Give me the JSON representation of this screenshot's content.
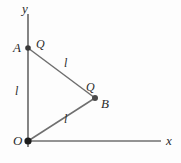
{
  "figure": {
    "background_color": "#fdfdfd",
    "line_color": "#6b6b6b",
    "point_color": "#2b2b2b",
    "text_color": "#2b2b2b"
  },
  "axes": {
    "y_label": "y",
    "x_label": "x",
    "origin_label": "O"
  },
  "points": [
    {
      "id": "origin",
      "label": "O",
      "x": 28,
      "y": 141
    },
    {
      "id": "a",
      "label": "A",
      "x": 28,
      "y": 48
    },
    {
      "id": "b",
      "label": "B",
      "x": 95,
      "y": 98
    }
  ],
  "charges": [
    {
      "id": "charge-at-a",
      "label": "Q",
      "x": 38,
      "y": 41
    },
    {
      "id": "charge-at-b",
      "label": "Q",
      "x": 88,
      "y": 84
    }
  ],
  "segments": [
    {
      "id": "segment-oa",
      "length_label": "l",
      "label_x": 15,
      "label_y": 90
    },
    {
      "id": "segment-ab",
      "length_label": "l",
      "label_x": 63,
      "label_y": 62
    },
    {
      "id": "segment-ob",
      "length_label": "l",
      "label_x": 63,
      "label_y": 117
    }
  ],
  "geometry": {
    "y_axis": {
      "x1": 28,
      "y1": 14,
      "x2": 28,
      "y2": 147
    },
    "x_axis": {
      "x1": 28,
      "y1": 141,
      "x2": 161,
      "y2": 141
    },
    "side_oa": {
      "x1": 28,
      "y1": 141,
      "x2": 28,
      "y2": 48
    },
    "side_ab": {
      "x1": 28,
      "y1": 48,
      "x2": 95,
      "y2": 98
    },
    "side_ob": {
      "x1": 28,
      "y1": 141,
      "x2": 95,
      "y2": 98
    }
  }
}
